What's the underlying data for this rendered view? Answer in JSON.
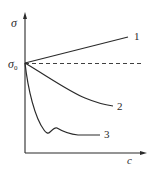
{
  "diagram": {
    "y_axis_label": "σ",
    "x_axis_label": "c",
    "origin_label_main": "σ",
    "origin_label_sub": "0",
    "curves": [
      {
        "id": "1",
        "label": "1",
        "trend": "increasing linear"
      },
      {
        "id": "2",
        "label": "2",
        "trend": "decreasing concave"
      },
      {
        "id": "3",
        "label": "3",
        "trend": "sharp drop with small bump then flat"
      }
    ],
    "reference_line": {
      "style": "dashed",
      "level": "σ0"
    },
    "colors": {
      "line": "#2a2a2a",
      "background": "#ffffff"
    }
  }
}
